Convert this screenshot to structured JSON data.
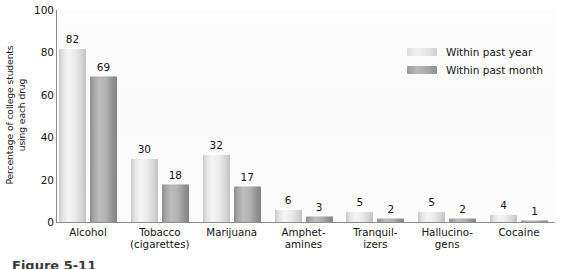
{
  "chart_data": {
    "type": "bar",
    "title": "",
    "subtitle": "",
    "xlabel": "",
    "ylabel_lines": [
      "Percentage of college students",
      "using each drug"
    ],
    "ylabel": "Percentage of college students using each drug",
    "ylim": [
      0,
      100
    ],
    "yticks": [
      0,
      20,
      40,
      60,
      80,
      100
    ],
    "grid": false,
    "legend_position": "top-right",
    "categories": [
      "Alcohol",
      "Tobacco (cigarettes)",
      "Marijuana",
      "Amphetamines",
      "Tranquilizers",
      "Hallucinogens",
      "Cocaine"
    ],
    "category_label_lines": [
      [
        "Alcohol"
      ],
      [
        "Tobacco",
        "(cigarettes)"
      ],
      [
        "Marijuana"
      ],
      [
        "Amphet-",
        "amines"
      ],
      [
        "Tranquil-",
        "izers"
      ],
      [
        "Hallucino-",
        "gens"
      ],
      [
        "Cocaine"
      ]
    ],
    "series": [
      {
        "name": "Within past year",
        "color": "#ededed",
        "values": [
          82,
          30,
          32,
          6,
          5,
          5,
          4
        ]
      },
      {
        "name": "Within past month",
        "color": "#b0b0b0",
        "values": [
          69,
          18,
          17,
          3,
          2,
          2,
          1
        ]
      }
    ]
  },
  "legend": {
    "items": [
      {
        "label": "Within past year",
        "swatch": "year"
      },
      {
        "label": "Within past month",
        "swatch": "month"
      }
    ]
  },
  "caption": {
    "text": "Figure 5-11"
  },
  "colors": {
    "axis": "#8b8b8b",
    "text": "#141414",
    "series_year": "#ededed",
    "series_month": "#b0b0b0",
    "plot_background": "#fafafa"
  }
}
